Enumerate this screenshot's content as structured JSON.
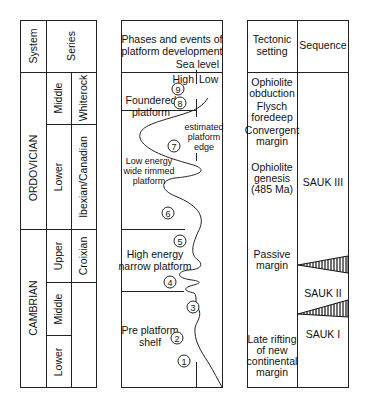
{
  "stratigraphy_table": {
    "headers": {
      "system": "System",
      "series": "Series"
    },
    "systems": [
      {
        "name": "ORDOVICIAN",
        "series": [
          {
            "epoch": "Middle",
            "stage": "Whiterock"
          },
          {
            "epoch": "Lower",
            "stage": "Ibexian/Canadian"
          }
        ]
      },
      {
        "name": "CAMBRIAN",
        "series": [
          {
            "epoch": "Upper",
            "stage": "Croixian"
          },
          {
            "epoch": "Middle",
            "stage": ""
          },
          {
            "epoch": "Lower",
            "stage": ""
          }
        ]
      }
    ]
  },
  "platform_column": {
    "title_line1": "Phases and events of",
    "title_line2": "platform development",
    "sea_level": "Sea level",
    "high": "High",
    "low": "Low",
    "phases": [
      {
        "line1": "Foundered",
        "line2": "platform"
      },
      {
        "line1": "Low energy",
        "line2": "wide rimmed",
        "line3": "platform"
      },
      {
        "line1": "High energy",
        "line2": "narrow platform"
      },
      {
        "line1": "Pre platform",
        "line2": "shelf"
      }
    ],
    "platform_edge_label": {
      "line1": "estimated",
      "line2": "platform",
      "line3": "edge"
    },
    "events": [
      "1",
      "2",
      "3",
      "4",
      "5",
      "6",
      "7",
      "8",
      "9"
    ]
  },
  "tectonic_table": {
    "headers": {
      "tectonic_line1": "Tectonic",
      "tectonic_line2": "setting",
      "sequence": "Sequence"
    },
    "settings": [
      {
        "lines": [
          "Ophiolite",
          "obduction"
        ]
      },
      {
        "lines": [
          "Flysch",
          "foredeep"
        ]
      },
      {
        "lines": [
          "Convergent",
          "margin"
        ]
      },
      {
        "lines": [
          "Ophiolite",
          "genesis",
          "(485 Ma)"
        ]
      },
      {
        "lines": [
          "Passive",
          "margin"
        ]
      },
      {
        "lines": [
          "Late rifting",
          "of new",
          "continental",
          "margin"
        ]
      }
    ],
    "sequences": [
      "SAUK III",
      "SAUK II",
      "SAUK I"
    ]
  }
}
